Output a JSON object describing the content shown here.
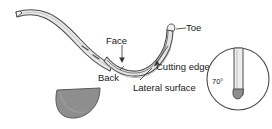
{
  "figure": {
    "background_color": "#ffffff",
    "labels": {
      "toe": "Toe",
      "face": "Face",
      "back": "Back",
      "cutting_edge": "Cutting edge",
      "lateral_surface": "Lateral surface",
      "angle": "70°"
    },
    "colors": {
      "outline": "#4d4d4d",
      "shank_fill": "#e8e8e8",
      "blade_fill": "#d9d9d9",
      "cross_section_fill": "#8e8e8e",
      "tip_fill": "#8e8e8e",
      "text": "#1a1a1a",
      "leader_line": "#333333"
    },
    "parts": {
      "shank": "curved-shank",
      "blade": "curved-blade",
      "cross_section": "semicircular-cross-section",
      "inset": "angle-inset-circle"
    }
  }
}
